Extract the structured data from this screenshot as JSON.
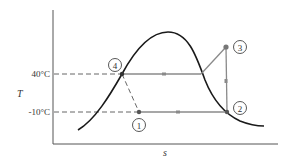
{
  "diagram": {
    "type": "T-s diagram (vapor-compression refrigeration cycle)",
    "x_axis_label": "s",
    "y_axis_label": "T",
    "temperature_levels": [
      {
        "label": "40°C",
        "y": 74
      },
      {
        "label": "-10°C",
        "y": 112
      }
    ],
    "states": [
      {
        "id": "1",
        "label": "1",
        "x": 139,
        "y": 112,
        "label_x": 139,
        "label_y": 125
      },
      {
        "id": "2",
        "label": "2",
        "x": 227,
        "y": 112,
        "label_x": 240,
        "label_y": 108
      },
      {
        "id": "3",
        "label": "3",
        "x": 226,
        "y": 47,
        "label_x": 240,
        "label_y": 47
      },
      {
        "id": "4",
        "label": "4",
        "x": 122,
        "y": 74,
        "label_x": 115,
        "label_y": 65
      }
    ],
    "processes": [
      {
        "from": "1",
        "to": "2",
        "style": "solid",
        "arrow": true
      },
      {
        "from": "2",
        "to": "3",
        "style": "solid",
        "arrow": true
      },
      {
        "from": "3",
        "to": "4",
        "style": "solid",
        "arrow": true,
        "via": "saturated vapor line then horizontal"
      },
      {
        "from": "4",
        "to": "1",
        "style": "dashed",
        "arrow": false
      }
    ],
    "colors": {
      "dome": "#1a1a1a",
      "cycle": "#8a8a8a",
      "axes": "#555555",
      "dashed": "#666666",
      "label": "#333333"
    }
  }
}
